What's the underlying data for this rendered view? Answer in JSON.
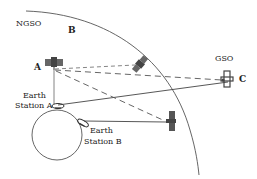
{
  "labels": {
    "ngso": "NGSO",
    "gso": "GSO",
    "sat_a": "A",
    "sat_b": "B",
    "sat_c": "C",
    "es_a_line1": "Earth",
    "es_a_line2": "Station A",
    "es_b_line1": "Earth",
    "es_b_line2": "Station B"
  },
  "colors": {
    "line": "#444444",
    "satellite": "#555555"
  }
}
